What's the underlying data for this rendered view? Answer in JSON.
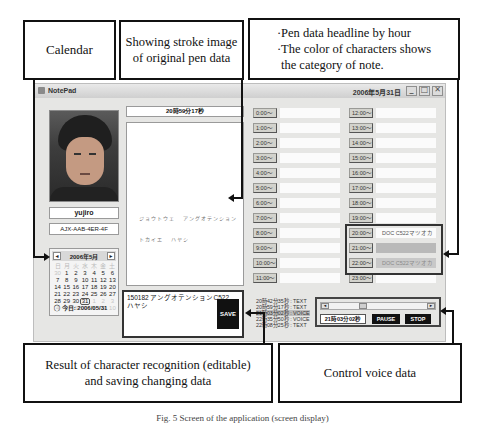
{
  "callouts": {
    "calendar": "Calendar",
    "stroke": [
      "Showing stroke image",
      "of original pen data"
    ],
    "headline": [
      "·Pen data headline by hour",
      "·The color of characters shows",
      " the category of note."
    ],
    "recognition": [
      "Result of character recognition (editable)",
      "and saving changing data"
    ],
    "voice": "Control voice data"
  },
  "window": {
    "title": "NotePad",
    "date": "2006年5月31日",
    "controls": {
      "minimize": "_",
      "maximize": "□",
      "close": "✕"
    }
  },
  "user": {
    "name": "yujiro",
    "id": "AJX-AAB-4ER-4F"
  },
  "calendar": {
    "month_label": "2006年5月",
    "prev": "◄",
    "next": "►",
    "weekdays": [
      "日",
      "月",
      "火",
      "水",
      "木",
      "金",
      "土"
    ],
    "rows": [
      [
        "30",
        "1",
        "2",
        "3",
        "4",
        "5",
        "6"
      ],
      [
        "7",
        "8",
        "9",
        "10",
        "11",
        "12",
        "13"
      ],
      [
        "14",
        "15",
        "16",
        "17",
        "18",
        "19",
        "20"
      ],
      [
        "21",
        "22",
        "23",
        "24",
        "25",
        "26",
        "27"
      ],
      [
        "28",
        "29",
        "30",
        "31",
        "1",
        "2",
        "3"
      ],
      [
        "4",
        "5",
        "6",
        "7",
        "8",
        "9",
        "10"
      ]
    ],
    "today_label": "今日: 2006/05/31"
  },
  "stroke": {
    "time": "20時59分17秒",
    "text_lines": [
      "ジョウトウェ  アングオテンション",
      "トカイエ  ハヤシ"
    ]
  },
  "recognition": {
    "lines": [
      "150182  アングオテンションC522",
      "ハヤシ"
    ],
    "save_label": "SAVE"
  },
  "hours_left": [
    {
      "label": "0:00～",
      "text": ""
    },
    {
      "label": "1:00～",
      "text": ""
    },
    {
      "label": "2:00～",
      "text": ""
    },
    {
      "label": "3:00～",
      "text": ""
    },
    {
      "label": "4:00～",
      "text": ""
    },
    {
      "label": "5:00～",
      "text": ""
    },
    {
      "label": "6:00～",
      "text": ""
    },
    {
      "label": "7:00～",
      "text": ""
    },
    {
      "label": "8:00～",
      "text": ""
    },
    {
      "label": "9:00～",
      "text": ""
    },
    {
      "label": "10:00～",
      "text": ""
    },
    {
      "label": "11:00～",
      "text": ""
    }
  ],
  "hours_right": [
    {
      "label": "12:00～",
      "text": ""
    },
    {
      "label": "13:00～",
      "text": ""
    },
    {
      "label": "14:00～",
      "text": ""
    },
    {
      "label": "15:00～",
      "text": ""
    },
    {
      "label": "16:00～",
      "text": ""
    },
    {
      "label": "17:00～",
      "text": ""
    },
    {
      "label": "18:00～",
      "text": ""
    },
    {
      "label": "19:00～",
      "text": ""
    },
    {
      "label": "20:00～",
      "text": "DOC  C522マツオカ"
    },
    {
      "label": "21:00～",
      "text": ""
    },
    {
      "label": "22:00～",
      "text": "DOC  C522マツオカ"
    },
    {
      "label": "23:00～",
      "text": ""
    }
  ],
  "log": [
    "20時42分35秒 : TEXT",
    "20時59分17秒 : TEXT",
    "21時03分02秒 : VOICE",
    "22時35分50秒 : VOICE",
    "22時08分25秒 : TEXT"
  ],
  "voice": {
    "time": "21時03分02秒",
    "pause_label": "PAUSE",
    "stop_label": "STOP",
    "scroll_left": "◄",
    "scroll_right": "►"
  },
  "caption": "Fig. 5  Screen of the application (screen display)",
  "colors": {
    "window_bg": "#e6e6e4",
    "category_gray": "#b9b9b9",
    "button_dark": "#111111"
  }
}
